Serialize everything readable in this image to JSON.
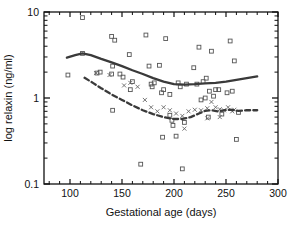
{
  "chart_data": {
    "type": "scatter",
    "title": "",
    "xlabel": "Gestational age (days)",
    "ylabel": "log relaxin (ng/ml)",
    "xlim": [
      75,
      300
    ],
    "ylim": [
      0.1,
      10
    ],
    "yscale": "log",
    "xticks": [
      100,
      150,
      200,
      250,
      300
    ],
    "xtick_labels": [
      "100",
      "150",
      "200",
      "250",
      "300"
    ],
    "yticks": [
      0.1,
      1,
      10
    ],
    "ytick_labels": [
      "0.1",
      "1",
      "10"
    ],
    "grid": false,
    "legend": "none",
    "frame": "full-box",
    "series": [
      {
        "name": "open-square-markers",
        "marker": "open-square",
        "color": "#555555",
        "points": [
          [
            98,
            1.85
          ],
          [
            112,
            8.6
          ],
          [
            112,
            3.3
          ],
          [
            126,
            1.95
          ],
          [
            129,
            2.0
          ],
          [
            140,
            5.2
          ],
          [
            141,
            2.35
          ],
          [
            143,
            4.7
          ],
          [
            140,
            1.9
          ],
          [
            141,
            0.72
          ],
          [
            148,
            1.9
          ],
          [
            151,
            1.75
          ],
          [
            157,
            3.2
          ],
          [
            158,
            1.25
          ],
          [
            160,
            1.55
          ],
          [
            168,
            0.17
          ],
          [
            173,
            5.4
          ],
          [
            176,
            2.35
          ],
          [
            178,
            1.45
          ],
          [
            179,
            1.35
          ],
          [
            181,
            1.5
          ],
          [
            186,
            2.4
          ],
          [
            188,
            1.15
          ],
          [
            189,
            0.35
          ],
          [
            190,
            1.25
          ],
          [
            192,
            4.9
          ],
          [
            196,
            1.1
          ],
          [
            196,
            0.63
          ],
          [
            198,
            0.55
          ],
          [
            199,
            0.48
          ],
          [
            202,
            0.36
          ],
          [
            204,
            1.5
          ],
          [
            206,
            1.35
          ],
          [
            208,
            0.15
          ],
          [
            210,
            0.52
          ],
          [
            212,
            1.45
          ],
          [
            219,
            2.25
          ],
          [
            222,
            1.45
          ],
          [
            224,
            3.9
          ],
          [
            226,
            0.95
          ],
          [
            228,
            1.55
          ],
          [
            230,
            1.0
          ],
          [
            231,
            1.7
          ],
          [
            233,
            0.6
          ],
          [
            234,
            1.2
          ],
          [
            236,
            3.5
          ],
          [
            238,
            1.05
          ],
          [
            240,
            1.25
          ],
          [
            243,
            1.25
          ],
          [
            246,
            0.65
          ],
          [
            251,
            1.15
          ],
          [
            254,
            4.6
          ],
          [
            256,
            1.2
          ],
          [
            258,
            2.7
          ],
          [
            260,
            0.33
          ],
          [
            262,
            0.68
          ]
        ]
      },
      {
        "name": "x-markers",
        "marker": "x",
        "color": "#666666",
        "points": [
          [
            125,
            1.95
          ],
          [
            138,
            1.85
          ],
          [
            152,
            1.4
          ],
          [
            158,
            1.5
          ],
          [
            165,
            1.35
          ],
          [
            172,
            0.95
          ],
          [
            178,
            0.78
          ],
          [
            184,
            0.7
          ],
          [
            190,
            0.78
          ],
          [
            196,
            0.72
          ],
          [
            202,
            0.66
          ],
          [
            208,
            0.62
          ],
          [
            214,
            0.7
          ],
          [
            220,
            0.73
          ],
          [
            226,
            0.72
          ],
          [
            232,
            0.76
          ],
          [
            236,
            0.9
          ],
          [
            240,
            0.78
          ],
          [
            244,
            0.74
          ],
          [
            248,
            0.72
          ],
          [
            252,
            0.78
          ],
          [
            256,
            0.7
          ],
          [
            258,
            0.73
          ],
          [
            210,
            0.44
          ],
          [
            232,
            0.58
          ],
          [
            244,
            0.6
          ]
        ]
      }
    ],
    "curves": [
      {
        "name": "solid-trend-line",
        "style": "solid",
        "color": "#3a3a3a",
        "width": 2.3,
        "points": [
          [
            97,
            2.95
          ],
          [
            105,
            3.15
          ],
          [
            112,
            3.3
          ],
          [
            120,
            3.15
          ],
          [
            130,
            2.85
          ],
          [
            140,
            2.6
          ],
          [
            150,
            2.35
          ],
          [
            160,
            2.1
          ],
          [
            170,
            1.9
          ],
          [
            180,
            1.7
          ],
          [
            190,
            1.55
          ],
          [
            200,
            1.45
          ],
          [
            210,
            1.43
          ],
          [
            220,
            1.45
          ],
          [
            230,
            1.48
          ],
          [
            240,
            1.5
          ],
          [
            250,
            1.55
          ],
          [
            260,
            1.62
          ],
          [
            270,
            1.7
          ],
          [
            280,
            1.78
          ]
        ]
      },
      {
        "name": "dashed-trend-line",
        "style": "dashed",
        "color": "#3a3a3a",
        "width": 2.3,
        "points": [
          [
            114,
            1.72
          ],
          [
            122,
            1.5
          ],
          [
            130,
            1.3
          ],
          [
            140,
            1.1
          ],
          [
            150,
            0.95
          ],
          [
            160,
            0.82
          ],
          [
            170,
            0.72
          ],
          [
            180,
            0.65
          ],
          [
            190,
            0.6
          ],
          [
            200,
            0.57
          ],
          [
            208,
            0.57
          ],
          [
            216,
            0.6
          ],
          [
            224,
            0.66
          ],
          [
            230,
            0.71
          ],
          [
            236,
            0.72
          ],
          [
            242,
            0.7
          ],
          [
            248,
            0.72
          ],
          [
            254,
            0.73
          ],
          [
            262,
            0.71
          ],
          [
            270,
            0.72
          ],
          [
            280,
            0.72
          ]
        ]
      }
    ]
  }
}
